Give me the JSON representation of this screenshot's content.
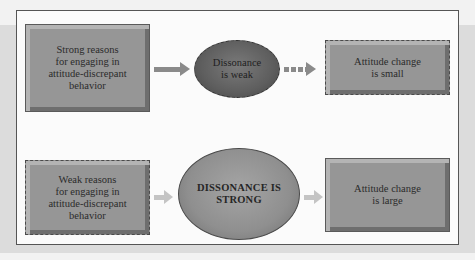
{
  "diagram": {
    "colors": {
      "page_background": "#f2f2f2",
      "panel_background": "#fbfbfb",
      "box_fill": "#969696",
      "weak_ellipse_fill": "#5e5e5e",
      "strong_ellipse_fill": "#8f8f8f",
      "arrow_dark": "#8a8a8a",
      "arrow_light": "#c4c4c4"
    },
    "rows": [
      {
        "cause": {
          "text": "Strong reasons for engaging in attitude-discrepant behavior",
          "line1": "Strong reasons",
          "line2": "for engaging in",
          "line3": "attitude-discrepant",
          "line4": "behavior",
          "border": "solid"
        },
        "arrow1": {
          "style": "solid-dark"
        },
        "dissonance": {
          "line1": "Dissonance",
          "line2": "is weak",
          "size": "small"
        },
        "arrow2": {
          "style": "dotted-dark"
        },
        "outcome": {
          "line1": "Attitude change",
          "line2": "is small",
          "border": "dashed"
        }
      },
      {
        "cause": {
          "text": "Weak reasons for engaging in attitude-discrepant behavior",
          "line1": "Weak reasons",
          "line2": "for engaging in",
          "line3": "attitude-discrepant",
          "line4": "behavior",
          "border": "dashed"
        },
        "arrow1": {
          "style": "solid-light"
        },
        "dissonance": {
          "line1": "DISSONANCE IS",
          "line2": "STRONG",
          "size": "large"
        },
        "arrow2": {
          "style": "solid-light"
        },
        "outcome": {
          "line1": "Attitude change",
          "line2": "is large",
          "border": "solid"
        }
      }
    ]
  }
}
